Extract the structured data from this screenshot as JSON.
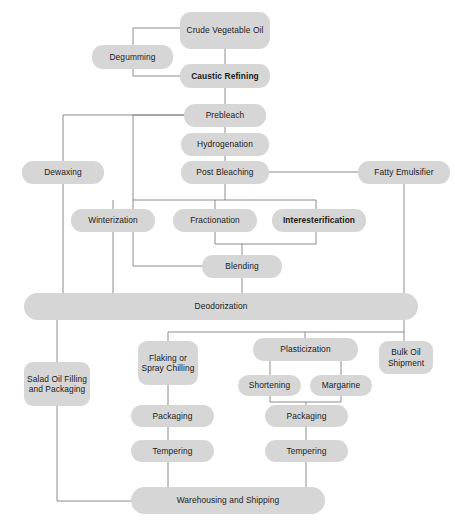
{
  "diagram": {
    "type": "flowchart",
    "background_color": "#ffffff",
    "node_fill_color": "#d6d6d6",
    "edge_color": "#808080",
    "text_color": "#1a1a1a",
    "nodes": [
      {
        "id": "crude_vegetable_oil",
        "label": "Crude Vegetable Oil",
        "x": 180,
        "y": 12,
        "w": 90,
        "h": 37,
        "bold": false,
        "shape": "rounded"
      },
      {
        "id": "degumming",
        "label": "Degumming",
        "x": 92,
        "y": 45,
        "w": 81,
        "h": 24,
        "bold": false,
        "shape": "rounded"
      },
      {
        "id": "caustic_refining",
        "label": "Caustic Refining",
        "x": 180,
        "y": 64,
        "w": 90,
        "h": 24,
        "bold": true,
        "shape": "rounded"
      },
      {
        "id": "prebleach",
        "label": "Prebleach",
        "x": 184,
        "y": 104,
        "w": 82,
        "h": 23,
        "bold": false,
        "shape": "rounded"
      },
      {
        "id": "hydrogenation",
        "label": "Hydrogenation",
        "x": 181,
        "y": 133,
        "w": 88,
        "h": 23,
        "bold": false,
        "shape": "rounded"
      },
      {
        "id": "post_bleaching",
        "label": "Post Bleaching",
        "x": 181,
        "y": 161,
        "w": 88,
        "h": 23,
        "bold": false,
        "shape": "rounded"
      },
      {
        "id": "dewaxing",
        "label": "Dewaxing",
        "x": 22,
        "y": 161,
        "w": 82,
        "h": 23,
        "bold": false,
        "shape": "rounded"
      },
      {
        "id": "fatty_emulsifier",
        "label": "Fatty Emulsifier",
        "x": 358,
        "y": 161,
        "w": 92,
        "h": 23,
        "bold": false,
        "shape": "rounded"
      },
      {
        "id": "winterization",
        "label": "Winterization",
        "x": 71,
        "y": 209,
        "w": 84,
        "h": 23,
        "bold": false,
        "shape": "rounded"
      },
      {
        "id": "fractionation",
        "label": "Fractionation",
        "x": 173,
        "y": 209,
        "w": 84,
        "h": 23,
        "bold": false,
        "shape": "rounded"
      },
      {
        "id": "interesterification",
        "label": "Interesterification",
        "x": 272,
        "y": 209,
        "w": 94,
        "h": 23,
        "bold": true,
        "shape": "rounded"
      },
      {
        "id": "blending",
        "label": "Blending",
        "x": 202,
        "y": 255,
        "w": 80,
        "h": 23,
        "bold": false,
        "shape": "rounded"
      },
      {
        "id": "deodorization",
        "label": "Deodorization",
        "x": 24,
        "y": 293,
        "w": 394,
        "h": 27,
        "bold": false,
        "shape": "bar"
      },
      {
        "id": "salad_oil_filling_packaging",
        "label": "Salad Oil Filling and Packaging",
        "x": 24,
        "y": 362,
        "w": 66,
        "h": 44,
        "bold": false,
        "shape": "tall"
      },
      {
        "id": "flaking_spray_chilling",
        "label": "Flaking or Spray Chilling",
        "x": 138,
        "y": 341,
        "w": 60,
        "h": 44,
        "bold": false,
        "shape": "tall"
      },
      {
        "id": "plasticization",
        "label": "Plasticization",
        "x": 253,
        "y": 338,
        "w": 105,
        "h": 23,
        "bold": false,
        "shape": "rounded"
      },
      {
        "id": "bulk_oil_shipment",
        "label": "Bulk Oil Shipment",
        "x": 379,
        "y": 341,
        "w": 54,
        "h": 33,
        "bold": false,
        "shape": "tall"
      },
      {
        "id": "shortening",
        "label": "Shortening",
        "x": 238,
        "y": 375,
        "w": 63,
        "h": 21,
        "bold": false,
        "shape": "rounded"
      },
      {
        "id": "margarine",
        "label": "Margarine",
        "x": 310,
        "y": 375,
        "w": 62,
        "h": 21,
        "bold": false,
        "shape": "rounded"
      },
      {
        "id": "packaging_flaking",
        "label": "Packaging",
        "x": 131,
        "y": 405,
        "w": 83,
        "h": 22,
        "bold": false,
        "shape": "rounded"
      },
      {
        "id": "packaging_plasticization",
        "label": "Packaging",
        "x": 265,
        "y": 405,
        "w": 83,
        "h": 22,
        "bold": false,
        "shape": "rounded"
      },
      {
        "id": "tempering_flaking",
        "label": "Tempering",
        "x": 131,
        "y": 440,
        "w": 83,
        "h": 22,
        "bold": false,
        "shape": "rounded"
      },
      {
        "id": "tempering_plasticization",
        "label": "Tempering",
        "x": 265,
        "y": 440,
        "w": 83,
        "h": 22,
        "bold": false,
        "shape": "rounded"
      },
      {
        "id": "warehousing_shipping",
        "label": "Warehousing and Shipping",
        "x": 131,
        "y": 487,
        "w": 194,
        "h": 27,
        "bold": false,
        "shape": "bar"
      }
    ],
    "edges": [
      {
        "from": "crude_vegetable_oil",
        "to": "caustic_refining",
        "path": "M225,49 L225,64"
      },
      {
        "from": "crude_vegetable_oil",
        "to": "degumming",
        "path": "M180,28 L133,28 L133,57 L92,57"
      },
      {
        "from": "degumming",
        "to": "caustic_refining",
        "path": "M92,57 L133,57 L133,76 L180,76"
      },
      {
        "from": "caustic_refining",
        "to": "prebleach",
        "path": "M225,88 L225,104"
      },
      {
        "from": "prebleach",
        "to": "hydrogenation",
        "path": "M225,127 L225,133"
      },
      {
        "from": "hydrogenation",
        "to": "post_bleaching",
        "path": "M225,156 L225,161"
      },
      {
        "from": "prebleach",
        "to": "dewaxing",
        "path": "M184,115 L63,115 L63,161"
      },
      {
        "from": "prebleach",
        "to": "branch_bus",
        "path": "M184,115 L133,115 L133,200"
      },
      {
        "from": "post_bleaching",
        "to": "fatty_emulsifier",
        "path": "M269,172 L358,172"
      },
      {
        "from": "post_bleaching",
        "to": "bracket",
        "path": "M225,184 L225,200"
      },
      {
        "from": "bracket",
        "to": "winterization",
        "path": "M133,200 L316,200 M113,200 L113,209 M215,200 L215,209 M316,200 L316,209"
      },
      {
        "from": "dewaxing",
        "to": "deodorization",
        "path": "M63,184 L63,293"
      },
      {
        "from": "winterization",
        "to": "deodorization",
        "path": "M113,232 L113,293"
      },
      {
        "from": "fractionation",
        "to": "blending",
        "path": "M215,232 L215,244 L242,244 L242,255"
      },
      {
        "from": "interesterification",
        "to": "blending",
        "path": "M316,232 L316,244 L242,244"
      },
      {
        "from": "blending_left_bus",
        "to": "blending",
        "path": "M133,200 L133,266 L202,266"
      },
      {
        "from": "blending",
        "to": "deodorization",
        "path": "M242,278 L242,293"
      },
      {
        "from": "fatty_emulsifier",
        "to": "deodorization",
        "path": "M404,184 L404,293"
      },
      {
        "from": "deodorization",
        "to": "salad_oil_filling_packaging",
        "path": "M57,320 L57,362"
      },
      {
        "from": "deodorization",
        "to": "lower_bus",
        "path": "M404,320 L404,332 L168,332 L168,341"
      },
      {
        "from": "lower_bus",
        "to": "plasticization",
        "path": "M305,332 L305,338"
      },
      {
        "from": "lower_bus",
        "to": "bulk_oil_shipment",
        "path": "M404,332 L404,341"
      },
      {
        "from": "plasticization",
        "to": "shortening",
        "path": "M270,361 L270,375"
      },
      {
        "from": "plasticization",
        "to": "margarine",
        "path": "M341,361 L341,375"
      },
      {
        "from": "shortening",
        "to": "packaging_plasticization",
        "path": "M270,396 L270,402 L306,402 L306,405"
      },
      {
        "from": "margarine",
        "to": "packaging_plasticization",
        "path": "M341,396 L341,402 L306,402"
      },
      {
        "from": "flaking_spray_chilling",
        "to": "packaging_flaking",
        "path": "M168,385 L168,405"
      },
      {
        "from": "packaging_flaking",
        "to": "tempering_flaking",
        "path": "M168,427 L168,440"
      },
      {
        "from": "packaging_plasticization",
        "to": "tempering_plasticization",
        "path": "M306,427 L306,440"
      },
      {
        "from": "tempering_flaking",
        "to": "warehousing_shipping",
        "path": "M168,462 L168,487"
      },
      {
        "from": "tempering_plasticization",
        "to": "warehousing_shipping",
        "path": "M306,462 L306,487"
      },
      {
        "from": "salad_oil_filling_packaging",
        "to": "warehousing_shipping",
        "path": "M57,406 L57,501 L131,501"
      }
    ]
  }
}
